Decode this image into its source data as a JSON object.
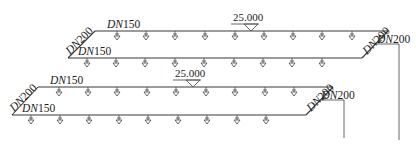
{
  "diagram": {
    "type": "sprinkler-pipe-isometric",
    "systems": [
      {
        "id": "upper",
        "branch_top": {
          "label": "DN150",
          "y": 31,
          "x1": 95,
          "x2": 388,
          "sprinklers_x": [
            117,
            146,
            175,
            205,
            235,
            264,
            293,
            322,
            352
          ]
        },
        "branch_bottom": {
          "label": "DN150",
          "y": 58,
          "x1": 68,
          "x2": 362,
          "sprinklers_x": [
            87,
            116,
            145,
            175,
            204,
            234,
            263,
            292,
            322
          ]
        },
        "left_connector": {
          "label": "DN200"
        },
        "right_connector": {
          "label": "DN200"
        },
        "riser": {
          "label": "DN200",
          "x": 399,
          "y_top": 44,
          "y_bottom": 140
        },
        "elevation": {
          "value": "25.000",
          "x": 251
        }
      },
      {
        "id": "lower",
        "branch_top": {
          "label": "DN150",
          "y": 87,
          "x1": 38,
          "x2": 333,
          "sprinklers_x": [
            59,
            88,
            117,
            147,
            176,
            206,
            235,
            265,
            294
          ]
        },
        "branch_bottom": {
          "label": "DN150",
          "y": 115,
          "x1": 12,
          "x2": 306,
          "sprinklers_x": [
            31,
            60,
            89,
            119,
            148,
            178,
            207,
            237,
            266
          ]
        },
        "left_connector": {
          "label": "DN200"
        },
        "right_connector": {
          "label": "DN200"
        },
        "riser": {
          "label": "DN200",
          "x": 344,
          "y_top": 100,
          "y_bottom": 138
        },
        "elevation": {
          "value": "25.000",
          "x": 193
        }
      }
    ]
  }
}
